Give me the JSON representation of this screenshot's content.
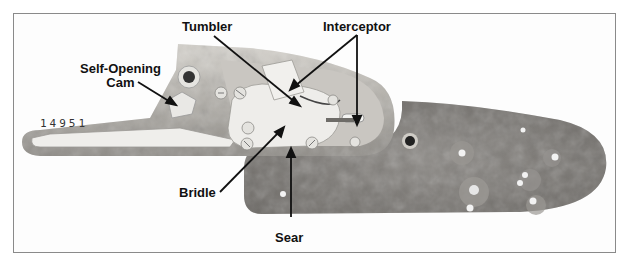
{
  "figure": {
    "serial_number": "14951",
    "colors": {
      "frame_border": "#8a8a8a",
      "lock_plate": "#b8b5b0",
      "lock_plate_light": "#dedbd5",
      "parts": "#ecebe8",
      "wood_dark": "#6f6c68",
      "wood_mid": "#8b8884",
      "label_text": "#111111"
    },
    "labels": [
      {
        "id": "self-opening-cam",
        "line1": "Self-Opening",
        "line2": "Cam"
      },
      {
        "id": "tumbler",
        "text": "Tumbler"
      },
      {
        "id": "interceptor",
        "text": "Interceptor"
      },
      {
        "id": "bridle",
        "text": "Bridle"
      },
      {
        "id": "sear",
        "text": "Sear"
      }
    ]
  }
}
